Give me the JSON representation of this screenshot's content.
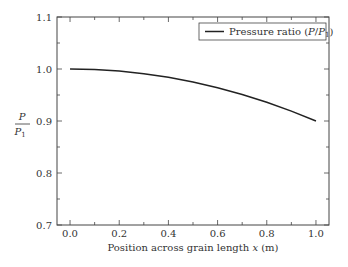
{
  "chart_data": {
    "type": "line",
    "title": "",
    "xlabel": "Position across grain length x (m)",
    "xlabel_parts": {
      "pre": "Position across grain length ",
      "var": "x",
      "post": " (m)"
    },
    "ylabel": "P/P1",
    "ylabel_parts": {
      "num": "P",
      "den": "P",
      "den_sub": "1"
    },
    "xlim": [
      -0.053,
      1.053
    ],
    "ylim": [
      0.7,
      1.1
    ],
    "xticks": [
      0.0,
      0.2,
      0.4,
      0.6,
      0.8,
      1.0
    ],
    "xtick_labels": [
      "0.0",
      "0.2",
      "0.4",
      "0.6",
      "0.8",
      "1.0"
    ],
    "xminor_step": 0.1,
    "yticks": [
      0.7,
      0.8,
      0.9,
      1.0,
      1.1
    ],
    "ytick_labels": [
      "0.7",
      "0.8",
      "0.9",
      "1.0",
      "1.1"
    ],
    "yminor_step": 0.05,
    "grid": false,
    "legend_position": "upper right",
    "series": [
      {
        "name": "Pressure ratio (P/P1)",
        "legend_parts": {
          "pre": "Pressure ratio (",
          "var1": "P",
          "slash": "/",
          "var2": "P",
          "sub": "1",
          "post": ")"
        },
        "color": "#222222",
        "x": [
          0.0,
          0.1,
          0.2,
          0.3,
          0.4,
          0.5,
          0.6,
          0.7,
          0.8,
          0.9,
          1.0
        ],
        "values": [
          1.0,
          0.999,
          0.996,
          0.991,
          0.984,
          0.975,
          0.964,
          0.951,
          0.936,
          0.919,
          0.9
        ]
      }
    ]
  }
}
